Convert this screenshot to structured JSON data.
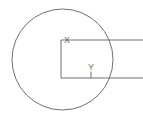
{
  "figure": {
    "width": 143,
    "height": 121,
    "background_color": "#ffffff",
    "stroke_color": "#6e6e6e",
    "labels": {
      "x_label": "X",
      "y_label": "Y"
    },
    "shapes": {
      "circle": {
        "name": "circle",
        "center_x": 62.5,
        "center_y": 59.5,
        "radius": 50.5
      },
      "rectangle": {
        "name": "open-rectangle",
        "left": 61,
        "top": 40,
        "bottom": 78,
        "right": 143
      },
      "y_tick": {
        "name": "y-tick",
        "x": 91,
        "top": 72,
        "bottom": 78
      }
    },
    "label_positions": {
      "x": {
        "x": 67,
        "y": 41
      },
      "y": {
        "x": 91,
        "y": 68
      }
    }
  }
}
